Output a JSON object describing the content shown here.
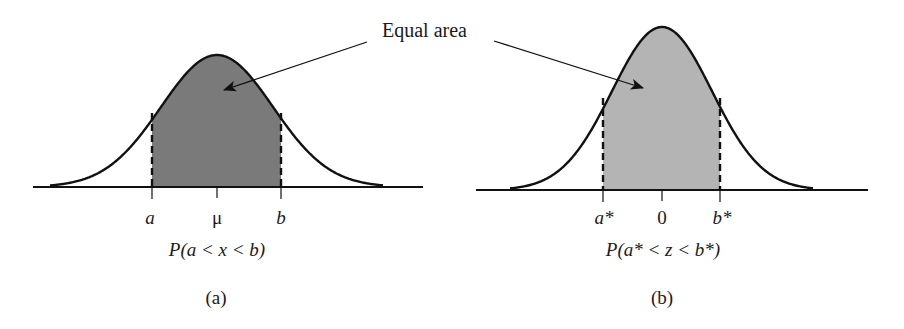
{
  "annotation": {
    "label": "Equal area"
  },
  "panels": [
    {
      "id": "a",
      "caption": "(a)",
      "probability_expression": "P(a < x < b)",
      "tick_labels": {
        "lower": "a",
        "center": "μ",
        "upper": "b"
      },
      "shade_color": "#7a7a7a",
      "distribution": "normal (general)"
    },
    {
      "id": "b",
      "caption": "(b)",
      "probability_expression": "P(a* < z < b*)",
      "tick_labels": {
        "lower": "a*",
        "center": "0",
        "upper": "b*"
      },
      "shade_color": "#b4b4b4",
      "distribution": "standard normal"
    }
  ],
  "colors": {
    "line": "#111111",
    "background": "#ffffff"
  }
}
